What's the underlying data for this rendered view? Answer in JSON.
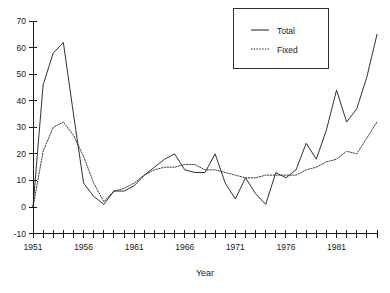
{
  "chart_data": {
    "type": "line",
    "title": "",
    "xlabel": "Year",
    "ylabel": "",
    "xlim": [
      1951,
      1985
    ],
    "ylim": [
      -10,
      70
    ],
    "grid": false,
    "legend_position": "top-right",
    "x": [
      1951,
      1952,
      1953,
      1954,
      1955,
      1956,
      1957,
      1958,
      1959,
      1960,
      1961,
      1962,
      1963,
      1964,
      1965,
      1966,
      1967,
      1968,
      1969,
      1970,
      1971,
      1972,
      1973,
      1974,
      1975,
      1976,
      1977,
      1978,
      1979,
      1980,
      1981,
      1982,
      1983,
      1984,
      1985
    ],
    "x_tick_labels": [
      "1951",
      "1956",
      "1961",
      "1966",
      "1971",
      "1976",
      "1981"
    ],
    "x_tick_values": [
      1951,
      1956,
      1961,
      1966,
      1971,
      1976,
      1981
    ],
    "y_tick_labels": [
      "-10",
      "0",
      "10",
      "20",
      "30",
      "40",
      "50",
      "60",
      "70"
    ],
    "y_tick_values": [
      -10,
      0,
      10,
      20,
      30,
      40,
      50,
      60,
      70
    ],
    "series": [
      {
        "name": "Total",
        "style": "solid",
        "color": "#1a1a1a",
        "values": [
          0,
          46,
          58,
          62,
          35,
          9,
          4,
          1,
          6,
          6,
          8,
          12,
          15,
          18,
          20,
          14,
          13,
          13,
          20,
          9,
          3,
          11,
          5,
          1,
          13,
          11,
          14,
          24,
          18,
          29,
          44,
          32,
          37,
          49,
          65
        ]
      },
      {
        "name": "Fixed",
        "style": "dotted",
        "color": "#1a1a1a",
        "values": [
          0,
          21,
          30,
          32,
          27,
          19,
          9,
          2,
          6,
          7,
          9,
          12,
          14,
          15,
          15,
          16,
          16,
          14,
          14,
          13,
          12,
          11,
          11,
          12,
          12,
          12,
          12,
          14,
          15,
          17,
          18,
          21,
          20,
          26,
          32
        ]
      }
    ]
  },
  "legend": {
    "entries": [
      {
        "label": "Total"
      },
      {
        "label": "Fixed"
      }
    ]
  },
  "axes": {
    "x_title": "Year"
  }
}
